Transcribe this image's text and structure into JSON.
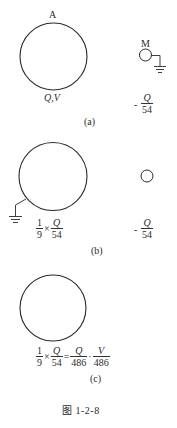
{
  "figure": {
    "caption": "图  1-2-8",
    "stroke_color": "#2a2a2a"
  },
  "panel_a": {
    "sphere_label_top": "A",
    "sphere_label_bottom": "Q,V",
    "small_sphere_label": "M",
    "small_charge": {
      "sign": "-",
      "num": "Q",
      "den": "54"
    },
    "sublabel": "(a)"
  },
  "panel_b": {
    "big_charge": {
      "coef_num": "1",
      "coef_den": "9",
      "op": "×",
      "num": "Q",
      "den": "54"
    },
    "small_charge": {
      "sign": "-",
      "num": "Q",
      "den": "54"
    },
    "sublabel": "(b)"
  },
  "panel_c": {
    "big_charge": {
      "coef_num": "1",
      "coef_den": "9",
      "op": "×",
      "num1": "Q",
      "den1": "54",
      "eq": "=",
      "num2": "Q",
      "den2": "486",
      "sep": "·",
      "num3": "V",
      "den3": "486"
    },
    "sublabel": "(c)"
  }
}
